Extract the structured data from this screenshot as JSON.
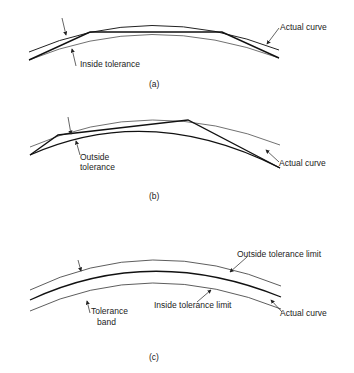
{
  "figure": {
    "panels": [
      {
        "id": "a",
        "caption": "(a)",
        "labels": {
          "actual_curve": "Actual curve",
          "tolerance": "Inside tolerance"
        }
      },
      {
        "id": "b",
        "caption": "(b)",
        "labels": {
          "actual_curve": "Actual curve",
          "tolerance_line1": "Outside",
          "tolerance_line2": "tolerance"
        }
      },
      {
        "id": "c",
        "caption": "(c)",
        "labels": {
          "outside_limit": "Outside tolerance limit",
          "inside_limit": "Inside tolerance limit",
          "actual_curve": "Actual curve",
          "band_line1": "Tolerance",
          "band_line2": "band"
        }
      }
    ],
    "colors": {
      "line": "#222222",
      "background": "#ffffff"
    }
  }
}
